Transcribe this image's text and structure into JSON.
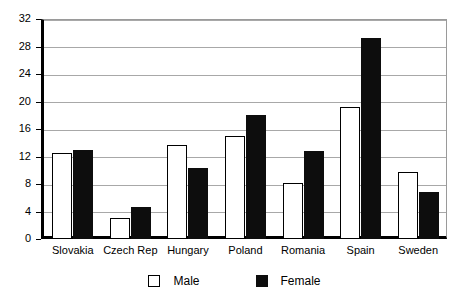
{
  "chart_data": {
    "type": "bar",
    "title": "",
    "xlabel": "",
    "ylabel": "",
    "ylim": [
      0,
      32
    ],
    "ytick_step": 4,
    "yticks": [
      0,
      4,
      8,
      12,
      16,
      20,
      24,
      28,
      32
    ],
    "grid": true,
    "legend_position": "bottom",
    "categories": [
      "Slovakia",
      "Czech Rep",
      "Hungary",
      "Poland",
      "Romania",
      "Spain",
      "Sweden"
    ],
    "series": [
      {
        "name": "Male",
        "color": "#ffffff",
        "edge_color": "#000000",
        "values": [
          12.5,
          3.0,
          13.7,
          15.0,
          8.2,
          19.2,
          9.8
        ]
      },
      {
        "name": "Female",
        "color": "#0d0d0d",
        "edge_color": "#0d0d0d",
        "values": [
          13.0,
          4.7,
          10.3,
          18.0,
          12.8,
          29.2,
          6.8
        ]
      }
    ]
  },
  "legend": {
    "items": [
      {
        "label": "Male",
        "marker": "open-square-marker"
      },
      {
        "label": "Female",
        "marker": "filled-square-marker"
      }
    ]
  },
  "axis": {
    "y_tick_labels": [
      "0",
      "4",
      "8",
      "12",
      "16",
      "20",
      "24",
      "28",
      "32"
    ],
    "x_tick_labels": [
      "Slovakia",
      "Czech Rep",
      "Hungary",
      "Poland",
      "Romania",
      "Spain",
      "Sweden"
    ]
  }
}
